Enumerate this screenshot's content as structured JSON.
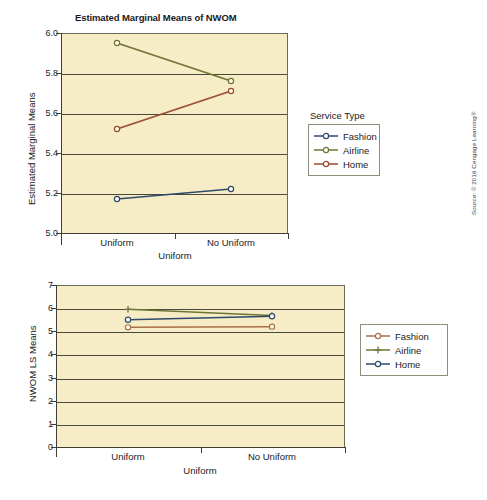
{
  "source_note": "Source: © 2016 Cengage Learning®",
  "chart_data": [
    {
      "id": "top",
      "type": "line",
      "title": "Estimated Marginal Means of NWOM",
      "xlabel": "Uniform",
      "ylabel": "Estimated Marginal Means",
      "categories": [
        "Uniform",
        "No Uniform"
      ],
      "ylim": [
        5.0,
        6.0
      ],
      "yticks": [
        "6.0",
        "5.8",
        "5.6",
        "5.4",
        "5.2",
        "5.0"
      ],
      "ytick_values": [
        6.0,
        5.8,
        5.6,
        5.4,
        5.2,
        5.0
      ],
      "grid": true,
      "legend_title": "Service Type",
      "legend_position": "right",
      "series": [
        {
          "name": "Fashion",
          "values": [
            5.17,
            5.22
          ],
          "color": "#2d4a6b",
          "marker": "circle"
        },
        {
          "name": "Airline",
          "values": [
            5.95,
            5.76
          ],
          "color": "#6e7436",
          "marker": "circle"
        },
        {
          "name": "Home",
          "values": [
            5.52,
            5.71
          ],
          "color": "#9a4a2c",
          "marker": "circle"
        }
      ]
    },
    {
      "id": "bottom",
      "type": "line",
      "title": "",
      "xlabel": "Uniform",
      "ylabel": "NWOM LS Means",
      "categories": [
        "Uniform",
        "No Uniform"
      ],
      "ylim": [
        0,
        7
      ],
      "yticks": [
        "7",
        "6",
        "5",
        "4",
        "3",
        "2",
        "1",
        "0"
      ],
      "ytick_values": [
        7,
        6,
        5,
        4,
        3,
        2,
        1,
        0
      ],
      "grid": true,
      "legend_title": "",
      "legend_position": "right",
      "series": [
        {
          "name": "Fashion",
          "values": [
            5.17,
            5.2
          ],
          "color": "#a8714a",
          "marker": "circle"
        },
        {
          "name": "Airline",
          "values": [
            5.95,
            5.68
          ],
          "color": "#6e7436",
          "marker": "plus"
        },
        {
          "name": "Home",
          "values": [
            5.5,
            5.65
          ],
          "color": "#2d4a6b",
          "marker": "circle"
        }
      ]
    }
  ]
}
